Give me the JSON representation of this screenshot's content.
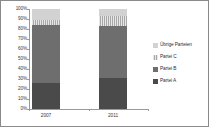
{
  "chart_data": {
    "type": "bar",
    "subtype": "stacked-100-percent",
    "title": "",
    "xlabel": "",
    "ylabel": "",
    "categories": [
      "2007",
      "2011"
    ],
    "series": [
      {
        "name": "Partei A",
        "values": [
          26,
          31
        ],
        "color": "#4a4a4a"
      },
      {
        "name": "Partei B",
        "values": [
          58,
          52
        ],
        "color": "#6e6e6e"
      },
      {
        "name": "Partei C",
        "values": [
          5,
          10
        ],
        "color": "#a8a8a8"
      },
      {
        "name": "Übrige Parteien",
        "values": [
          11,
          7
        ],
        "color": "#d2d2d2"
      }
    ],
    "ylim": [
      0,
      100
    ],
    "y_ticks": [
      "0%",
      "10%",
      "20%",
      "30%",
      "40%",
      "50%",
      "60%",
      "70%",
      "80%",
      "90%",
      "100%"
    ],
    "y_tick_values": [
      0,
      10,
      20,
      30,
      40,
      50,
      60,
      70,
      80,
      90,
      100
    ],
    "grid": false,
    "legend_position": "right",
    "legend": [
      "Übrige Parteien",
      "Partei C",
      "Partei B",
      "Partei A"
    ]
  },
  "axis": {
    "y_ticks": [
      {
        "label": "100%",
        "value": 100
      },
      {
        "label": "90%",
        "value": 90
      },
      {
        "label": "80%",
        "value": 80
      },
      {
        "label": "70%",
        "value": 70
      },
      {
        "label": "60%",
        "value": 60
      },
      {
        "label": "50%",
        "value": 50
      },
      {
        "label": "40%",
        "value": 40
      },
      {
        "label": "30%",
        "value": 30
      },
      {
        "label": "20%",
        "value": 20
      },
      {
        "label": "10%",
        "value": 10
      },
      {
        "label": "0%",
        "value": 0
      }
    ],
    "x_ticks": [
      {
        "label": "2007"
      },
      {
        "label": "2011"
      }
    ]
  },
  "legend": {
    "items": [
      {
        "label": "Übrige Parteien",
        "color": "#d2d2d2",
        "fill": "fill-uebrige"
      },
      {
        "label": "Partei C",
        "color": "#a8a8a8",
        "fill": "fill-c"
      },
      {
        "label": "Partei B",
        "color": "#6e6e6e",
        "fill": "fill-b"
      },
      {
        "label": "Partei A",
        "color": "#4a4a4a",
        "fill": "fill-a"
      }
    ]
  },
  "colors": {
    "background": "#ffffff",
    "frame": "#8a8a8a",
    "axis": "#9a9a9a",
    "text": "#3a3a3a"
  }
}
